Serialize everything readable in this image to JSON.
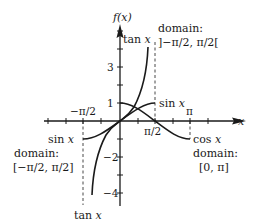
{
  "chart_data": {
    "type": "line",
    "title": "",
    "xlabel": "x",
    "ylabel": "f(x)",
    "xlim": [
      -2.0,
      3.8
    ],
    "ylim": [
      -4.5,
      4.6
    ],
    "grid": false,
    "x_ticks": [
      {
        "value": -1.5708,
        "label": "−π/2"
      },
      {
        "value": 1.5708,
        "label": "π/2"
      },
      {
        "value": 3.1416,
        "label": "π"
      }
    ],
    "y_ticks": [
      {
        "value": 1,
        "label": "1"
      },
      {
        "value": 3,
        "label": "3"
      },
      {
        "value": -2,
        "label": "−2"
      },
      {
        "value": -4,
        "label": "−4"
      }
    ],
    "series": [
      {
        "name": "sin x",
        "function": "sin",
        "domain": "[−π/2, π/2]",
        "x": [
          -1.5708,
          -1.1781,
          -0.7854,
          -0.3927,
          0,
          0.3927,
          0.7854,
          1.1781,
          1.5708
        ],
        "y": [
          -1,
          -0.924,
          -0.707,
          -0.383,
          0,
          0.383,
          0.707,
          0.924,
          1
        ]
      },
      {
        "name": "cos x",
        "function": "cos",
        "domain": "[0, π]",
        "x": [
          0,
          0.3927,
          0.7854,
          1.1781,
          1.5708,
          1.9635,
          2.3562,
          2.7489,
          3.1416
        ],
        "y": [
          1,
          0.924,
          0.707,
          0.383,
          0,
          -0.383,
          -0.707,
          -0.924,
          -1
        ]
      },
      {
        "name": "tan x",
        "function": "tan",
        "domain": "]−π/2, π/2[",
        "x": [
          -1.33,
          -1.25,
          -1.1,
          -0.9,
          -0.6,
          -0.3,
          0,
          0.3,
          0.6,
          0.9,
          1.1,
          1.25,
          1.33
        ],
        "y": [
          -4.1,
          -3.01,
          -1.96,
          -1.26,
          -0.68,
          -0.31,
          0,
          0.31,
          0.68,
          1.26,
          1.96,
          3.01,
          4.1
        ]
      }
    ],
    "asymptotes": [
      {
        "x": -1.5708,
        "style": "dashed"
      },
      {
        "x": 1.5708,
        "style": "dashed"
      }
    ],
    "annotations": [
      {
        "text": "tan x",
        "near": "top of tan curve"
      },
      {
        "text": "domain:",
        "near": "upper right"
      },
      {
        "text": "]−π/2, π/2[",
        "near": "upper right"
      },
      {
        "text": "sin x",
        "near": "right end of sin curve"
      },
      {
        "text": "sin x",
        "near": "left end of sin curve"
      },
      {
        "text": "domain:",
        "near": "left"
      },
      {
        "text": "[−π/2, π/2]",
        "near": "left"
      },
      {
        "text": "cos x",
        "near": "right end of cos curve"
      },
      {
        "text": "domain:",
        "near": "lower right"
      },
      {
        "text": "[0, π]",
        "near": "lower right"
      },
      {
        "text": "tan x",
        "near": "bottom of tan curve"
      }
    ]
  },
  "axes": {
    "y_label": "f(x)",
    "x_label": "x",
    "tick_labels": {
      "neg_half_pi": "−π/2",
      "half_pi": "π/2",
      "pi": "π",
      "one": "1",
      "three": "3",
      "neg_two": "−2",
      "neg_four": "−4"
    }
  },
  "labels": {
    "tan_top": "tan x",
    "tan_bottom": "tan x",
    "sin_right": "sin x",
    "sin_left": "sin x",
    "cos_right": "cos x",
    "tan_domain_title": "domain:",
    "tan_domain": "]−π/2, π/2[",
    "sin_domain_title": "domain:",
    "sin_domain": "[−π/2, π/2]",
    "cos_domain_title": "domain:",
    "cos_domain": "[0, π]"
  },
  "colors": {
    "ink": "#1a1a1a",
    "background": "#ffffff"
  }
}
